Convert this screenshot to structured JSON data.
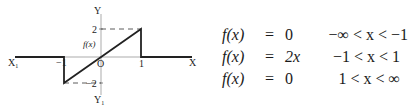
{
  "graph": {
    "axis_labels": {
      "x_pos": "X",
      "x_neg": "X",
      "x_neg_sub": "1",
      "y_pos": "Y",
      "y_neg": "Y",
      "y_neg_sub": "1",
      "origin": "O"
    },
    "tick_labels": {
      "x_minus_one": "−1",
      "x_one": "1",
      "y_two": "2",
      "y_minus_two": "−2"
    },
    "curve_label": "f(x)",
    "segments": [
      {
        "from": [
          -2.3,
          0
        ],
        "to": [
          -1,
          0
        ]
      },
      {
        "from": [
          -1,
          0
        ],
        "to": [
          -1,
          -2
        ]
      },
      {
        "from": [
          -1,
          -2
        ],
        "to": [
          1,
          2
        ]
      },
      {
        "from": [
          1,
          2
        ],
        "to": [
          1,
          0
        ]
      },
      {
        "from": [
          1,
          0
        ],
        "to": [
          2.3,
          0
        ]
      }
    ],
    "dashed_guides": [
      {
        "from": [
          0,
          2
        ],
        "to": [
          1,
          2
        ]
      },
      {
        "from": [
          -1,
          -2
        ],
        "to": [
          0,
          -2
        ]
      }
    ]
  },
  "equations": [
    {
      "lhs": "f(x)",
      "eq": "=",
      "rhs": "0",
      "cond": "−∞ < x < −1"
    },
    {
      "lhs": "f(x)",
      "eq": "=",
      "rhs": "2x",
      "cond": "−1 < x < 1"
    },
    {
      "lhs": "f(x)",
      "eq": "=",
      "rhs": "0",
      "cond": "1 < x < ∞"
    }
  ]
}
